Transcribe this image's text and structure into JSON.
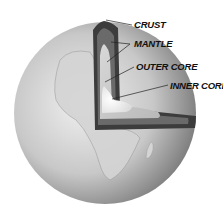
{
  "diagram": {
    "labels": [
      {
        "id": "crust",
        "text": "CRUST"
      },
      {
        "id": "mantle",
        "text": "MANTLE"
      },
      {
        "id": "outer_core",
        "text": "OUTER CORE"
      },
      {
        "id": "inner_core",
        "text": "INNER CORE"
      }
    ],
    "colors": {
      "background": "#ffffff",
      "crust": "#4a4a4a",
      "mantle": "#6e6e6e",
      "outer_core": "#cfcfcf",
      "inner_core": "#f2f2f2",
      "globe_light": "#e6e6e6",
      "globe_dark": "#7a7a7a"
    }
  }
}
